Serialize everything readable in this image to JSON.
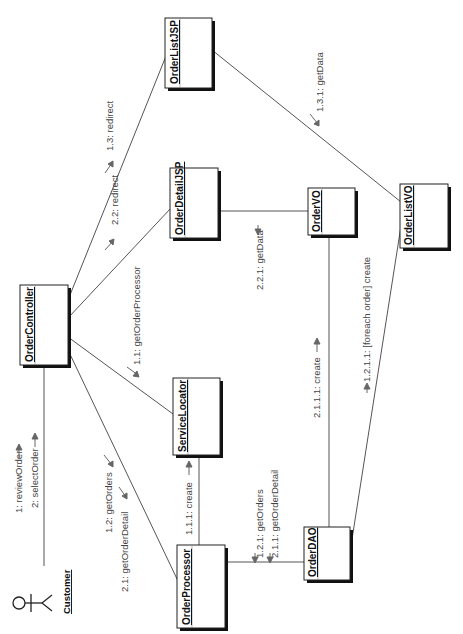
{
  "diagram": {
    "type": "UML collaboration diagram (rotated 90°)",
    "actor": {
      "name": "Customer"
    },
    "objects": [
      {
        "id": "orderListJSP",
        "name": "OrderListJSP"
      },
      {
        "id": "orderDetailJSP",
        "name": "OrderDetailJSP"
      },
      {
        "id": "orderVO",
        "name": "OrderVO"
      },
      {
        "id": "orderListVO",
        "name": "OrderListVO"
      },
      {
        "id": "orderController",
        "name": "OrderController"
      },
      {
        "id": "serviceLocator",
        "name": "ServiceLocator"
      },
      {
        "id": "orderProcessor",
        "name": "OrderProcessor"
      },
      {
        "id": "orderDAO",
        "name": "OrderDAO"
      }
    ],
    "messages": {
      "m1": "1: reviewOrder",
      "m2": "2: selectOrder",
      "m1_1": "1.1: getOrderProcessor",
      "m1_1_1": "1.1.1: create",
      "m1_2": "1.2: getOrders",
      "m2_1": "2.1: getOrderDetail",
      "m1_2_1": "1.2.1: getOrders",
      "m2_1_1": "2.1.1: getOrderDetail",
      "m2_1_1_1": "2.1.1.1: create",
      "m1_2_1_1": "1.2.1.1: [foreach order] create",
      "m1_3": "1.3: redirect",
      "m2_2": "2.2: redirect",
      "m1_3_1": "1.3.1: getData",
      "m2_2_1": "2.2.1: getData"
    }
  }
}
